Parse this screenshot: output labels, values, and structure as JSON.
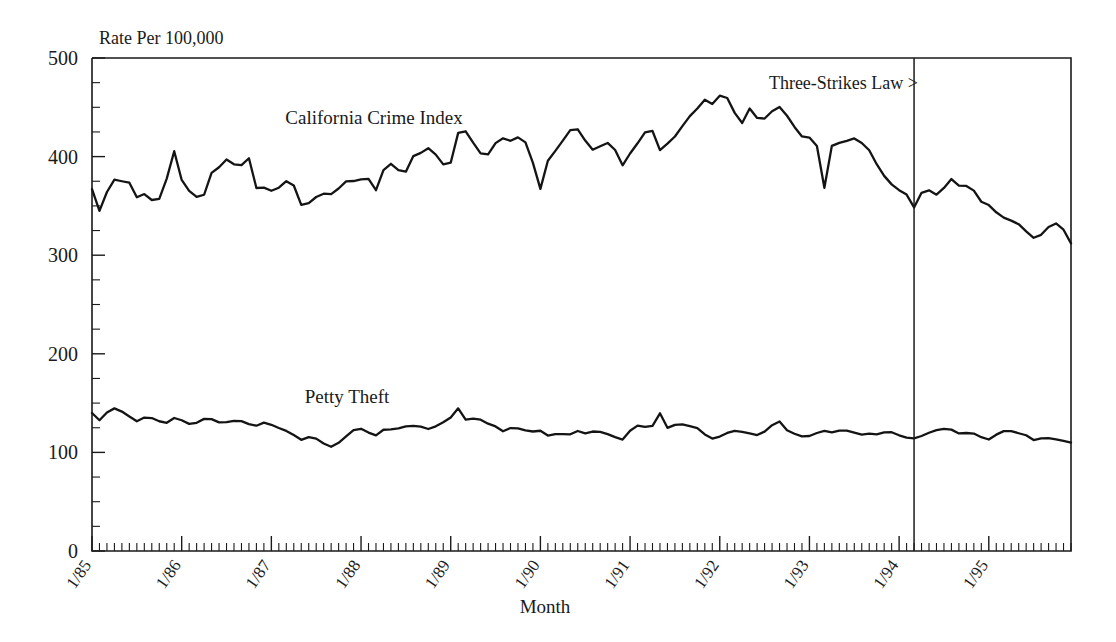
{
  "chart_data": {
    "type": "line",
    "title": "",
    "xlabel": "Month",
    "ylabel": "",
    "unit_label": "Rate Per 100,000",
    "ylim": [
      0,
      500
    ],
    "ytick_values": [
      0,
      100,
      200,
      300,
      400,
      500
    ],
    "ytick_labels": [
      "0",
      "100",
      "200",
      "300",
      "400",
      "500"
    ],
    "y_minor_tick_step": 25,
    "grid": false,
    "legend_position": "inline-labels",
    "x_start": "1/85",
    "x_end": "12/95",
    "x_tick_interval": "monthly",
    "xtick_labels": [
      "1/85",
      "1/86",
      "1/87",
      "1/88",
      "1/89",
      "1/90",
      "1/91",
      "1/92",
      "1/93",
      "1/94",
      "1/95"
    ],
    "xtick_year_indices": [
      0,
      12,
      24,
      36,
      48,
      60,
      72,
      84,
      96,
      108,
      120
    ],
    "annotations": [
      {
        "name": "three-strikes-law",
        "text": "Three-Strikes Law >",
        "type": "vertical-line-marker",
        "x_index": 110,
        "x_label": "3/94"
      }
    ],
    "series": [
      {
        "name": "California Crime Index",
        "label": "California Crime Index",
        "color": "#141414",
        "values": [
          367,
          340,
          378,
          375,
          375,
          357,
          364,
          349,
          372,
          406,
          369,
          363,
          354,
          383,
          390,
          400,
          385,
          404,
          367,
          369,
          363,
          376,
          372,
          348,
          355,
          363,
          361,
          368,
          377,
          374,
          381,
          365,
          390,
          394,
          378,
          400,
          404,
          410,
          396,
          386,
          424,
          426,
          408,
          398,
          413,
          419,
          415,
          423,
          400,
          367,
          402,
          408,
          426,
          429,
          415,
          404,
          416,
          410,
          391,
          406,
          418,
          433,
          406,
          414,
          423,
          438,
          447,
          458,
          452,
          468,
          448,
          433,
          451,
          434,
          443,
          452,
          441,
          427,
          416,
          424,
          366,
          418,
          412,
          420,
          415,
          406,
          388,
          375,
          367,
          362,
          346,
          372,
          359,
          367,
          378,
          368,
          372,
          355,
          351,
          342,
          336,
          334,
          325,
          317,
          322,
          334,
          329,
          312
        ],
        "note": "monthly 1/85 through 12/95 (partial annotation sampling)"
      },
      {
        "name": "Petty Theft",
        "label": "Petty Theft",
        "color": "#141414",
        "values": [
          140,
          131,
          146,
          143,
          137,
          131,
          137,
          133,
          129,
          135,
          132,
          127,
          134,
          134,
          130,
          131,
          133,
          129,
          127,
          131,
          126,
          123,
          118,
          112,
          117,
          111,
          105,
          110,
          118,
          126,
          121,
          117,
          124,
          123,
          126,
          127,
          126,
          123,
          129,
          133,
          145,
          131,
          136,
          130,
          127,
          121,
          126,
          123,
          121,
          122,
          116,
          120,
          117,
          122,
          119,
          122,
          120,
          116,
          113,
          124,
          129,
          122,
          141,
          123,
          130,
          127,
          126,
          118,
          113,
          118,
          122,
          121,
          119,
          117,
          125,
          133,
          122,
          118,
          115,
          119,
          122,
          120,
          123,
          121,
          118,
          119,
          118,
          122,
          118,
          115,
          114,
          118,
          122,
          124,
          123,
          118,
          121,
          116,
          113,
          119,
          123,
          120,
          118,
          112,
          115,
          114,
          112,
          110
        ],
        "note": "monthly 1/85 through 12/95 (partial annotation sampling)"
      }
    ]
  },
  "labels": {
    "unit": "Rate Per 100,000",
    "xaxis_title": "Month",
    "series_crime_index": "California Crime Index",
    "series_petty_theft": "Petty Theft",
    "annotation_three_strikes": "Three-Strikes Law >"
  },
  "ytick_labels": {
    "t0": "0",
    "t100": "100",
    "t200": "200",
    "t300": "300",
    "t400": "400",
    "t500": "500"
  },
  "xtick_labels": {
    "y85": "1/85",
    "y86": "1/86",
    "y87": "1/87",
    "y88": "1/88",
    "y89": "1/89",
    "y90": "1/90",
    "y91": "1/91",
    "y92": "1/92",
    "y93": "1/93",
    "y94": "1/94",
    "y95": "1/95"
  },
  "colors": {
    "line": "#141414",
    "axis": "#1a1a1a",
    "background": "#ffffff"
  }
}
